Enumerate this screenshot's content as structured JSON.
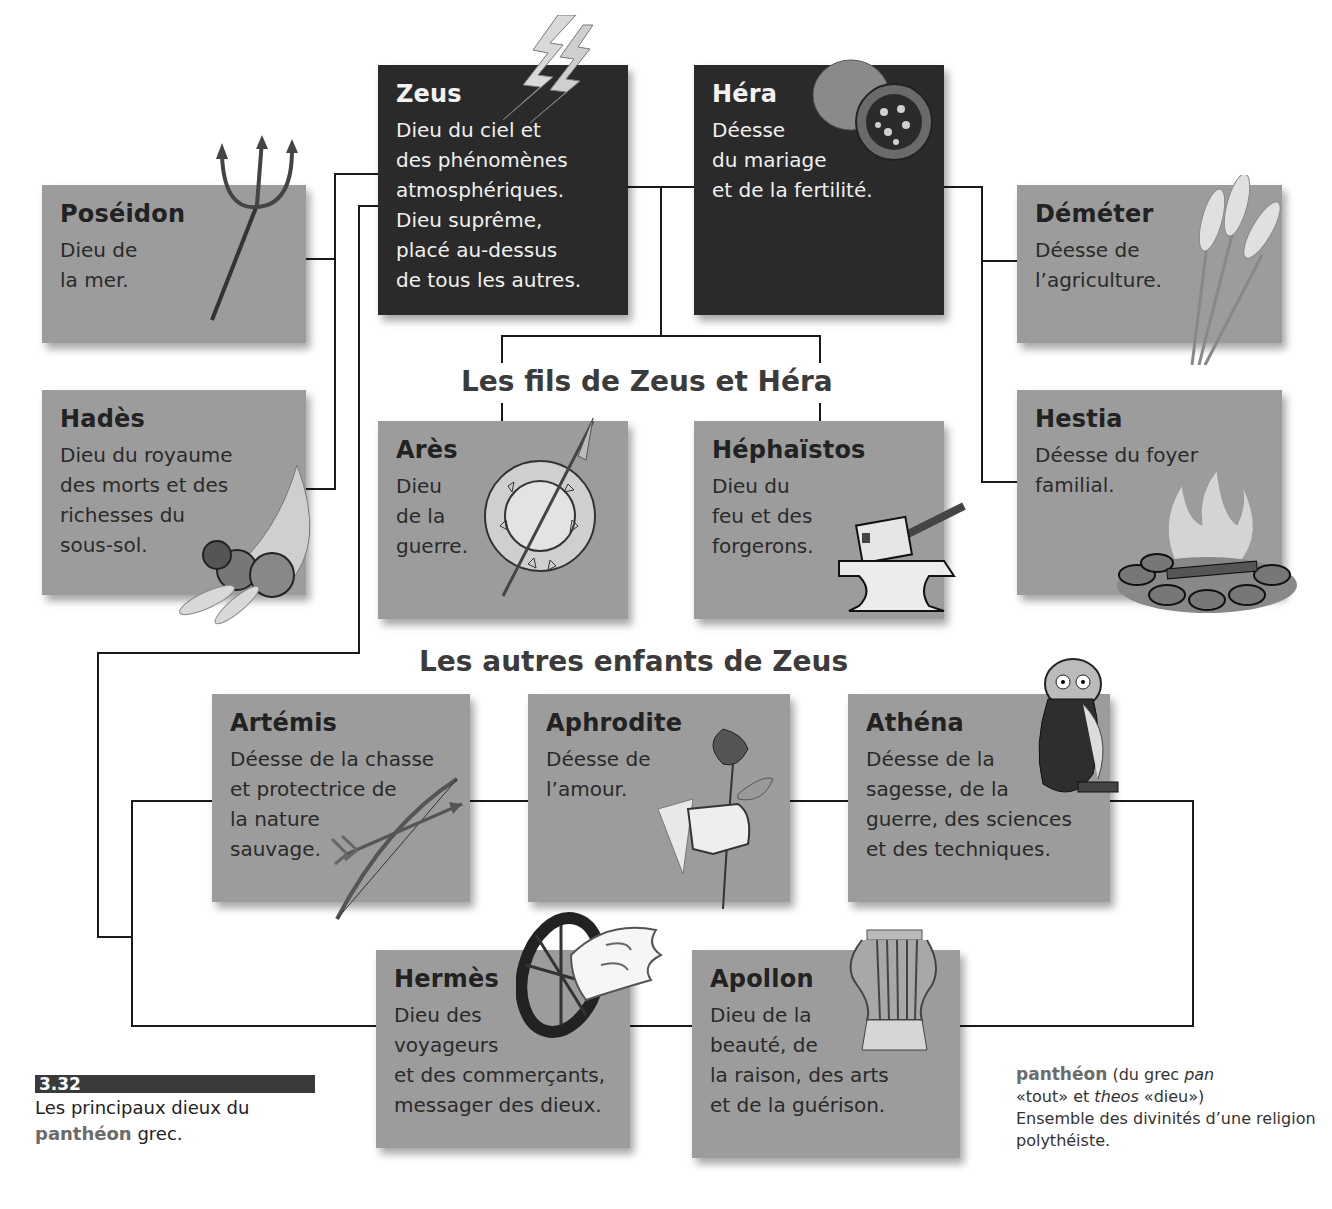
{
  "figure": {
    "number": "3.32",
    "caption_before": "Les principaux dieux du",
    "caption_keyword": "panthéon",
    "caption_after": "grec."
  },
  "glossary": {
    "term": "panthéon",
    "etymology_1": "(du grec",
    "pan": "pan",
    "pan_meaning": "«tout» et",
    "theos": "theos",
    "theos_meaning": "«dieu»)",
    "definition": "Ensemble des divinités d’une religion polythéiste."
  },
  "sections": {
    "sons": "Les fils de Zeus et Héra",
    "others": "Les autres enfants de Zeus"
  },
  "gods": {
    "zeus": {
      "name": "Zeus",
      "desc": "Dieu du ciel et\ndes phénomènes\natmosphériques.\nDieu suprême,\nplacé au-dessus\nde tous les autres.",
      "icon": "lightning-bolt"
    },
    "hera": {
      "name": "Héra",
      "desc": "Déesse\ndu mariage\net de la fertilité.",
      "icon": "pomegranate"
    },
    "poseidon": {
      "name": "Poséidon",
      "desc": "Dieu de\nla mer.",
      "icon": "trident"
    },
    "hades": {
      "name": "Hadès",
      "desc": "Dieu du royaume\ndes morts et des\nrichesses du\nsous-sol.",
      "icon": "cornucopia"
    },
    "demeter": {
      "name": "Déméter",
      "desc": "Déesse de\nl’agriculture.",
      "icon": "wheat"
    },
    "hestia": {
      "name": "Hestia",
      "desc": "Déesse du foyer\nfamilial.",
      "icon": "hearth-fire"
    },
    "ares": {
      "name": "Arès",
      "desc": "Dieu\nde la\nguerre.",
      "icon": "shield-spear"
    },
    "hephaistos": {
      "name": "Héphaïstos",
      "desc": "Dieu du\nfeu et des\nforgerons.",
      "icon": "anvil-hammer"
    },
    "artemis": {
      "name": "Artémis",
      "desc": "Déesse de la chasse\net protectrice de\nla nature\nsauvage.",
      "icon": "bow-arrow"
    },
    "aphrodite": {
      "name": "Aphrodite",
      "desc": "Déesse de\nl’amour.",
      "icon": "rose-hand"
    },
    "athena": {
      "name": "Athéna",
      "desc": "Déesse de la\nsagesse, de la\nguerre, des sciences\net des techniques.",
      "icon": "owl"
    },
    "hermes": {
      "name": "Hermès",
      "desc": "Dieu des\nvoyageurs\net des commerçants,\nmessager des dieux.",
      "icon": "winged-wheel"
    },
    "apollon": {
      "name": "Apollon",
      "desc": "Dieu de la\nbeauté, de\nla raison, des arts\net de la guérison.",
      "icon": "lyre"
    }
  },
  "colors": {
    "box_gray": "#9c9c9c",
    "box_dark": "#2a2a2a",
    "line": "#1a1a1a",
    "keyword": "#6b6b6b"
  }
}
